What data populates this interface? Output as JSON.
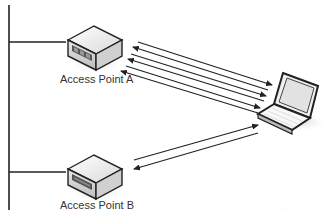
{
  "diagram": {
    "title": "",
    "nodes": [
      {
        "id": "ap-a",
        "type": "access-point",
        "label": "Access Point A"
      },
      {
        "id": "ap-b",
        "type": "access-point",
        "label": "Access Point B"
      },
      {
        "id": "client",
        "type": "laptop",
        "label": ""
      }
    ],
    "wired_backbone": {
      "type": "vertical-line",
      "connects": [
        "ap-a",
        "ap-b"
      ]
    },
    "links": [
      {
        "from": "ap-a",
        "to": "client",
        "count": 6,
        "style": "bidirectional-arrows"
      },
      {
        "from": "ap-b",
        "to": "client",
        "count": 2,
        "style": "bidirectional-arrows"
      }
    ],
    "watermark": "· · ·"
  },
  "colors": {
    "line": "#222222",
    "box_top": "#f2f2f2",
    "box_side": "#cfcfcf",
    "panel": "#555555",
    "shadow": "#e0e0e0"
  }
}
